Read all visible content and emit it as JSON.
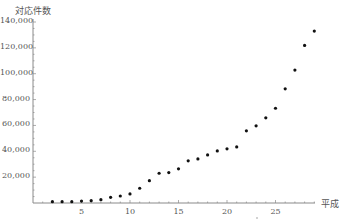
{
  "chart_data": {
    "type": "scatter",
    "title": "",
    "ylabel": "対応件数",
    "xlabel": "平成",
    "x": [
      2,
      3,
      4,
      5,
      6,
      7,
      8,
      9,
      10,
      11,
      12,
      13,
      14,
      15,
      16,
      17,
      18,
      19,
      20,
      21,
      22,
      23,
      24,
      25,
      26,
      27,
      28,
      29
    ],
    "values": [
      1000,
      1000,
      1000,
      1500,
      1800,
      2600,
      4400,
      5400,
      7000,
      11400,
      17300,
      23000,
      23500,
      26400,
      32600,
      34100,
      37200,
      40300,
      41900,
      43400,
      55800,
      59700,
      65900,
      73300,
      88300,
      102800,
      121900,
      133000
    ],
    "y_ticks": [
      "20,000",
      "40,000",
      "60,000",
      "80,000",
      "100,000",
      "120,000",
      "140,000"
    ],
    "y_tick_values": [
      20000,
      40000,
      60000,
      80000,
      100000,
      120000,
      140000
    ],
    "x_ticks": [
      "5",
      "10",
      "15",
      "20",
      "25"
    ],
    "x_tick_values": [
      5,
      10,
      15,
      20,
      25
    ],
    "xlim": [
      0,
      29.5
    ],
    "ylim": [
      0,
      140000
    ],
    "grid": false,
    "legend": "none",
    "colors": {
      "axis": "#8a8a8a",
      "point": "#111111",
      "text": "#555555"
    }
  }
}
